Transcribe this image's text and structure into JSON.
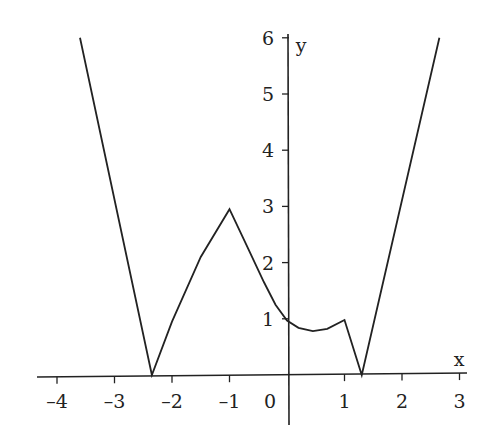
{
  "chart_data": {
    "type": "line",
    "title": "",
    "xlabel": "x",
    "ylabel": "y",
    "xlim": [
      -4.5,
      3.2
    ],
    "ylim": [
      -0.8,
      6.1
    ],
    "grid": false,
    "legend": null,
    "x_ticks": [
      -4,
      -3,
      -2,
      -1,
      0,
      1,
      2,
      3
    ],
    "x_tick_labels": [
      "–4",
      "–3",
      "–2",
      "–1",
      "0",
      "1",
      "2",
      "3"
    ],
    "y_ticks": [
      1,
      2,
      3,
      4,
      5,
      6
    ],
    "y_tick_labels": [
      "1",
      "2",
      "3",
      "4",
      "5",
      "6"
    ],
    "series": [
      {
        "name": "f(x)",
        "points": [
          [
            -3.6,
            6.0
          ],
          [
            -2.35,
            0.0
          ],
          [
            -2.0,
            0.95
          ],
          [
            -1.5,
            2.1
          ],
          [
            -1.0,
            2.95
          ],
          [
            -0.7,
            2.3
          ],
          [
            -0.4,
            1.65
          ],
          [
            -0.2,
            1.25
          ],
          [
            0.0,
            0.97
          ],
          [
            0.2,
            0.84
          ],
          [
            0.45,
            0.78
          ],
          [
            0.7,
            0.82
          ],
          [
            1.0,
            0.98
          ],
          [
            1.3,
            0.0
          ],
          [
            2.65,
            6.0
          ]
        ]
      }
    ]
  },
  "axes": {
    "x_label": "x",
    "y_label": "y",
    "origin_label": "0"
  }
}
